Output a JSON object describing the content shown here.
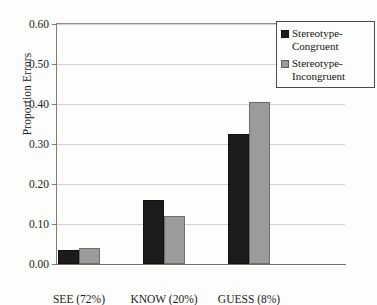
{
  "chart_data": {
    "type": "bar",
    "title": "",
    "xlabel": "",
    "ylabel": "Proportion Errors",
    "categories": [
      "SEE (72%)",
      "KNOW (20%)",
      "GUESS (8%)"
    ],
    "series": [
      {
        "name": "Stereotype-Congruent",
        "color": "#1c1c1c",
        "values": [
          0.035,
          0.16,
          0.325
        ]
      },
      {
        "name": "Stereotype-Incongruent",
        "color": "#9b9b9b",
        "values": [
          0.04,
          0.12,
          0.405
        ]
      }
    ],
    "ylim": [
      0.0,
      0.6
    ],
    "ytick_labels": [
      "0.00",
      "0.10",
      "0.20",
      "0.30",
      "0.40",
      "0.50",
      "0.60"
    ],
    "ytick_values": [
      0.0,
      0.1,
      0.2,
      0.3,
      0.4,
      0.5,
      0.6
    ],
    "grid": true,
    "legend_position": "top-right"
  },
  "legend": {
    "entries": [
      {
        "label": "Stereotype-Congruent"
      },
      {
        "label": "Stereotype-Incongruent"
      }
    ]
  }
}
